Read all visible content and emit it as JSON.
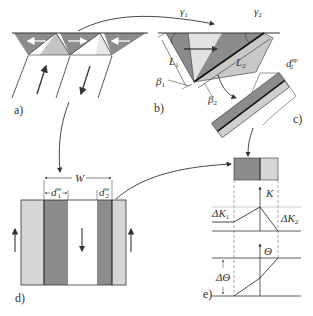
{
  "colors": {
    "dark_gray": "#8c8c8c",
    "mid_gray": "#b0b0b0",
    "light_gray": "#d6d6d6",
    "line": "#333333",
    "white": "#ffffff"
  },
  "panels": {
    "a": {
      "label": "a)"
    },
    "b": {
      "label": "b)",
      "gamma1": "γ",
      "gamma1_sub": "1",
      "gamma2": "γ",
      "gamma2_sub": "2",
      "L1": "L",
      "L1_sub": "1",
      "L2": "L",
      "L2_sub": "2",
      "beta1": "β",
      "beta1_sub": "1",
      "beta2": "β",
      "beta2_sub": "2"
    },
    "c": {
      "label": "c)",
      "d2sp": "d",
      "d2sp_sub": "2",
      "d2sp_sup": "sp"
    },
    "d": {
      "label": "d)",
      "W": "W",
      "d1w": "d",
      "d1w_sub": "1",
      "d1w_sup": "w",
      "d2w": "d",
      "d2w_sub": "2",
      "d2w_sup": "w"
    },
    "e": {
      "label": "e)",
      "K": "K",
      "dK1": "ΔK",
      "dK1_sub": "1",
      "dK2": "ΔK",
      "dK2_sub": "2",
      "Theta": "Θ",
      "dTheta": "ΔΘ"
    }
  }
}
